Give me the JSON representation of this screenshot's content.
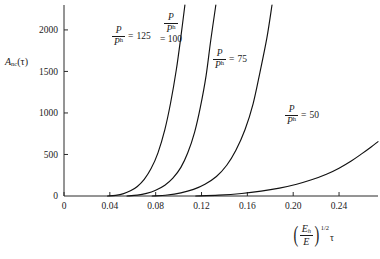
{
  "chart_data": {
    "type": "line",
    "title": "",
    "xlabel": "(E_h/E)^{1/2} tau",
    "ylabel": "A_nc(tau)",
    "xlim": [
      0,
      0.274
    ],
    "ylim": [
      0,
      2300
    ],
    "grid": false,
    "legend_position": "inline-annotations",
    "xticks": [
      "0",
      "0.04",
      "0.08",
      "0.12",
      "0.16",
      "0.20",
      "0.24"
    ],
    "xtick_values": [
      0,
      0.04,
      0.08,
      0.12,
      0.16,
      0.2,
      0.24
    ],
    "yticks": [
      "0",
      "500",
      "1000",
      "1500",
      "2000"
    ],
    "ytick_values": [
      0,
      500,
      1000,
      1500,
      2000
    ],
    "series": [
      {
        "name": "P/P^h = 125",
        "label_ratio": "125",
        "x": [
          0.038,
          0.045,
          0.052,
          0.058,
          0.064,
          0.07,
          0.076,
          0.082,
          0.088,
          0.093,
          0.098,
          0.102,
          0.1055
        ],
        "values": [
          0,
          8,
          28,
          62,
          115,
          200,
          330,
          520,
          800,
          1120,
          1520,
          1920,
          2300
        ]
      },
      {
        "name": "P/P^h = 100",
        "label_ratio": "100",
        "x": [
          0.055,
          0.064,
          0.072,
          0.08,
          0.088,
          0.095,
          0.102,
          0.108,
          0.114,
          0.119,
          0.124,
          0.128,
          0.1325
        ],
        "values": [
          0,
          10,
          32,
          70,
          130,
          215,
          345,
          520,
          770,
          1070,
          1450,
          1870,
          2300
        ]
      },
      {
        "name": "P/P^h = 75",
        "label_ratio": "75",
        "x": [
          0.077,
          0.09,
          0.102,
          0.113,
          0.123,
          0.133,
          0.142,
          0.15,
          0.158,
          0.165,
          0.171,
          0.177,
          0.1815
        ],
        "values": [
          0,
          12,
          38,
          80,
          142,
          235,
          370,
          550,
          800,
          1110,
          1490,
          1900,
          2300
        ]
      },
      {
        "name": "P/P^h = 50",
        "label_ratio": "50",
        "x": [
          0.115,
          0.135,
          0.155,
          0.172,
          0.188,
          0.203,
          0.216,
          0.229,
          0.24,
          0.251,
          0.26,
          0.268,
          0.274
        ],
        "values": [
          0,
          10,
          30,
          58,
          95,
          142,
          195,
          262,
          335,
          425,
          510,
          590,
          655
        ]
      }
    ],
    "annotations": [
      {
        "text": "P/P^h = 125",
        "x_px": 112,
        "y_px": 33
      },
      {
        "text": "P/P^h = 100",
        "x_px": 160,
        "y_px": 20
      },
      {
        "text": "P/P^h = 75",
        "x_px": 213,
        "y_px": 56
      },
      {
        "text": "P/P^h = 50",
        "x_px": 285,
        "y_px": 112
      }
    ],
    "symbols": {
      "P": "P",
      "P_h": "P",
      "P_h_sup": "h",
      "equals": "=",
      "A": "A",
      "A_sub": "nc",
      "tau": "τ",
      "E_h": "E",
      "E_h_sub": "h",
      "E": "E",
      "exponent": "1/2",
      "lparen": "(",
      "rparen": ")"
    }
  }
}
